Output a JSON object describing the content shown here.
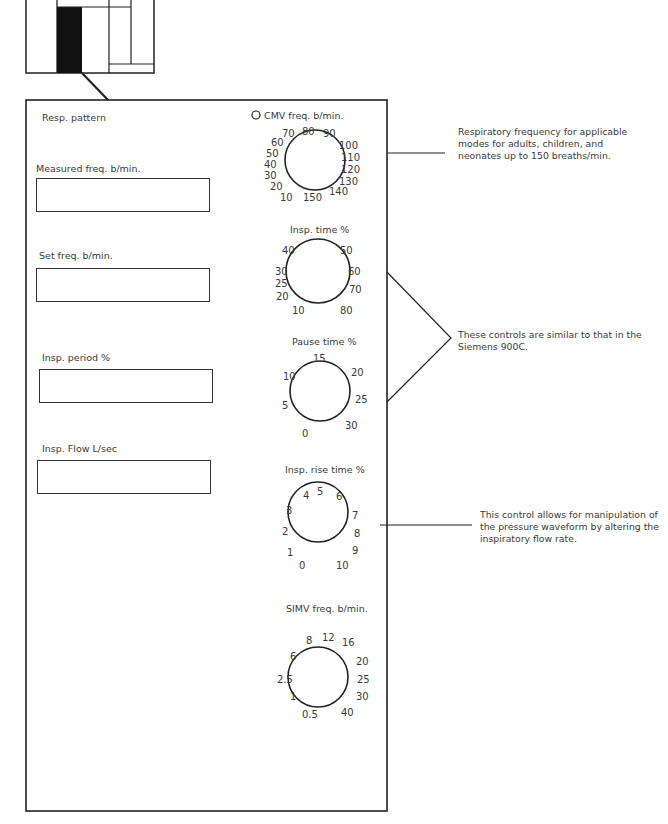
{
  "panel": {
    "title": "Resp. pattern",
    "fields": [
      {
        "label": "Measured freq. b/min.",
        "value": ""
      },
      {
        "label": "Set freq. b/min.",
        "value": ""
      },
      {
        "label": "Insp. period %",
        "value": ""
      },
      {
        "label": "Insp. Flow L/sec",
        "value": ""
      }
    ],
    "dials": [
      {
        "label": "CMV freq. b/min.",
        "has_indicator": true,
        "ticks": [
          "10",
          "20",
          "30",
          "40",
          "50",
          "60",
          "70",
          "80",
          "90",
          "100",
          "110",
          "120",
          "130",
          "140",
          "150"
        ]
      },
      {
        "label": "Insp. time %",
        "ticks": [
          "10",
          "20",
          "25",
          "30",
          "40",
          "50",
          "60",
          "70",
          "80"
        ]
      },
      {
        "label": "Pause time %",
        "ticks": [
          "0",
          "5",
          "10",
          "15",
          "20",
          "25",
          "30"
        ]
      },
      {
        "label": "Insp. rise time %",
        "ticks": [
          "0",
          "1",
          "2",
          "3",
          "4",
          "5",
          "6",
          "7",
          "8",
          "9",
          "10"
        ]
      },
      {
        "label": "SIMV freq. b/min.",
        "ticks": [
          "0.5",
          "1",
          "2.5",
          "6",
          "8",
          "12",
          "16",
          "20",
          "25",
          "30",
          "40"
        ]
      }
    ]
  },
  "annotations": [
    {
      "target": "CMV freq. b/min.",
      "lines": [
        "Respiratory frequency for applicable",
        "modes for adults, children, and",
        "neonates up to 150 breaths/min."
      ]
    },
    {
      "target": "Insp. time % / Pause time %",
      "lines": [
        "These controls are similar to that in the",
        "Siemens 900C."
      ]
    },
    {
      "target": "Insp. rise time %",
      "lines": [
        "This control allows for manipulation of",
        "the pressure waveform by altering the",
        "inspiratory flow rate."
      ]
    }
  ]
}
